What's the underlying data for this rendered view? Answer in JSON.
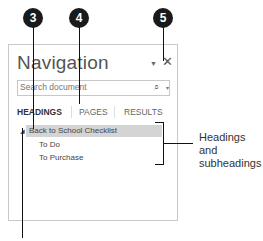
{
  "callouts": [
    {
      "number": "3",
      "target": "headings-tab"
    },
    {
      "number": "4",
      "target": "pages-tab"
    },
    {
      "number": "5",
      "target": "close-button"
    }
  ],
  "panel": {
    "title": "Navigation",
    "menu_icon": "dropdown-arrow-icon",
    "close_icon": "close-icon",
    "close_glyph": "✕",
    "menu_glyph": "▼",
    "search": {
      "placeholder": "Search document",
      "value": "",
      "icon": "search-icon",
      "icon_glyph": "⌕",
      "dropdown_glyph": "▾"
    },
    "tabs": [
      {
        "label": "HEADINGS",
        "active": true
      },
      {
        "label": "PAGES",
        "active": false
      },
      {
        "label": "RESULTS",
        "active": false
      }
    ],
    "tree": {
      "toggle_glyph": "◢",
      "items": [
        {
          "label": "Back to School Checklist",
          "level": 1,
          "selected": true
        },
        {
          "label": "To Do",
          "level": 2,
          "selected": false
        },
        {
          "label": "To Purchase",
          "level": 2,
          "selected": false
        }
      ]
    }
  },
  "annotation": {
    "line1": "Headings and",
    "line2": "subheadings"
  }
}
